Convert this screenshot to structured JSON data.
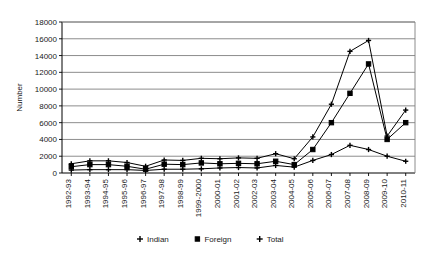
{
  "chart_data": {
    "type": "line",
    "title": "",
    "xlabel": "",
    "ylabel": "Number",
    "ylim": [
      0,
      18000
    ],
    "ytick_step": 2000,
    "yticks": [
      "0",
      "2000",
      "4000",
      "6000",
      "8000",
      "10000",
      "12000",
      "14000",
      "16000",
      "18000"
    ],
    "grid": true,
    "legend_position": "bottom",
    "categories": [
      "1992-93",
      "1993-94",
      "1994-95",
      "1995-96",
      "1996-97",
      "1997-98",
      "1998-99",
      "1999-2000",
      "2000-01",
      "2001-02",
      "2002-03",
      "2003-04",
      "2004-05",
      "2005-06",
      "2006-07",
      "2007-08",
      "2008-09",
      "2009-10",
      "2010-11"
    ],
    "series": [
      {
        "name": "Indian",
        "marker": "cross",
        "values": [
          350,
          400,
          400,
          400,
          300,
          450,
          450,
          500,
          600,
          650,
          600,
          900,
          700,
          1500,
          2200,
          3300,
          2800,
          2000,
          1400
        ]
      },
      {
        "name": "Foreign",
        "marker": "square",
        "values": [
          750,
          1000,
          1000,
          800,
          450,
          1050,
          1000,
          1200,
          1100,
          1150,
          1100,
          1400,
          1000,
          2800,
          6000,
          9500,
          13000,
          4000,
          6000
        ]
      },
      {
        "name": "Total",
        "marker": "cross",
        "values": [
          1100,
          1450,
          1450,
          1250,
          800,
          1550,
          1500,
          1750,
          1700,
          1800,
          1750,
          2300,
          1700,
          4300,
          8200,
          14500,
          15800,
          4400,
          7500
        ]
      }
    ]
  },
  "legend": {
    "items": [
      {
        "label": "Indian"
      },
      {
        "label": "Foreign"
      },
      {
        "label": "Total"
      }
    ]
  },
  "colors": {
    "line": "#000000",
    "grid": "#808080",
    "axis": "#000000",
    "background": "#ffffff"
  }
}
